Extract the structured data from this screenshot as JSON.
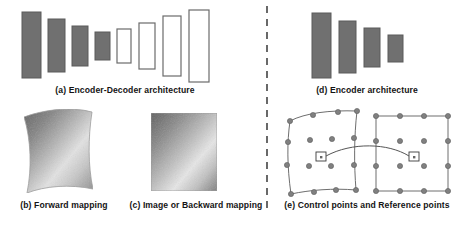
{
  "figure": {
    "width": 466,
    "height": 228,
    "background": "#ffffff",
    "divider": {
      "name": "dashed-vertical-divider",
      "x": 267,
      "y_start": 6,
      "y_end": 208,
      "style": "dashed",
      "color": "#444444"
    }
  },
  "captions": {
    "a": "(a) Encoder-Decoder architecture",
    "b": "(b) Forward mapping",
    "c": "(c) Image or Backward mapping",
    "d": "(d) Encoder architecture",
    "e": "(e) Control points and Reference points"
  },
  "colors": {
    "bar_fill": "#707070",
    "bar_stroke": "#5a5a5a",
    "empty_fill": "#ffffff",
    "empty_stroke": "#6b6b6b",
    "point_fill": "#808080",
    "point_stroke": "#5d5d5d",
    "grid_line": "#6e6e6e",
    "text": "#141414",
    "gradient_dark": "#5c5c5c",
    "gradient_light": "#f0f0f0"
  },
  "panel_a": {
    "label": "Encoder-Decoder architecture",
    "encoder_bars": [
      {
        "x": 22,
        "y": 12,
        "w": 19,
        "h": 66,
        "filled": true
      },
      {
        "x": 48,
        "y": 19,
        "w": 17,
        "h": 53,
        "filled": true
      },
      {
        "x": 72,
        "y": 26,
        "w": 16,
        "h": 40,
        "filled": true
      },
      {
        "x": 95,
        "y": 32,
        "w": 15,
        "h": 28,
        "filled": true
      }
    ],
    "decoder_bars": [
      {
        "x": 117,
        "y": 29,
        "w": 14,
        "h": 34,
        "filled": false
      },
      {
        "x": 139,
        "y": 23,
        "w": 16,
        "h": 46,
        "filled": false
      },
      {
        "x": 163,
        "y": 16,
        "w": 18,
        "h": 60,
        "filled": false
      },
      {
        "x": 189,
        "y": 10,
        "w": 20,
        "h": 72,
        "filled": false
      }
    ]
  },
  "panel_b": {
    "label": "Forward mapping",
    "shape": "warped-quadrilateral",
    "bounds": {
      "x": 22,
      "y": 112,
      "w": 71,
      "h": 81
    },
    "gradient": "diagonal-grayscale"
  },
  "panel_c": {
    "label": "Image or Backward mapping",
    "shape": "rectangle",
    "bounds": {
      "x": 151,
      "y": 113,
      "w": 66,
      "h": 78
    },
    "gradient": "diagonal-grayscale"
  },
  "panel_d": {
    "label": "Encoder architecture",
    "bars": [
      {
        "x": 312,
        "y": 13,
        "w": 19,
        "h": 65,
        "filled": true
      },
      {
        "x": 339,
        "y": 21,
        "w": 17,
        "h": 52,
        "filled": true
      },
      {
        "x": 364,
        "y": 28,
        "w": 16,
        "h": 39,
        "filled": true
      },
      {
        "x": 388,
        "y": 35,
        "w": 15,
        "h": 27,
        "filled": true
      }
    ]
  },
  "panel_e": {
    "label": "Control points and Reference points",
    "left_grid": {
      "name": "control-points-grid",
      "type": "warped",
      "rows": 4,
      "cols": 4,
      "points": [
        [
          290,
          121
        ],
        [
          313,
          115
        ],
        [
          338,
          113
        ],
        [
          357,
          111
        ],
        [
          287,
          142
        ],
        [
          310,
          140
        ],
        [
          332,
          139
        ],
        [
          352,
          138
        ],
        [
          285,
          164
        ],
        [
          308,
          165
        ],
        [
          330,
          165
        ],
        [
          351,
          164
        ],
        [
          291,
          194
        ],
        [
          314,
          192
        ],
        [
          336,
          191
        ],
        [
          356,
          190
        ]
      ],
      "marker": {
        "x": 320,
        "y": 157,
        "w": 9,
        "h": 8
      }
    },
    "right_grid": {
      "name": "reference-points-grid",
      "type": "regular",
      "rows": 4,
      "cols": 4,
      "points": [
        [
          376,
          116
        ],
        [
          400,
          116
        ],
        [
          424,
          116
        ],
        [
          448,
          116
        ],
        [
          376,
          141
        ],
        [
          400,
          141
        ],
        [
          424,
          141
        ],
        [
          448,
          141
        ],
        [
          376,
          166
        ],
        [
          400,
          166
        ],
        [
          424,
          166
        ],
        [
          448,
          166
        ],
        [
          376,
          191
        ],
        [
          400,
          191
        ],
        [
          424,
          191
        ],
        [
          448,
          191
        ]
      ],
      "marker": {
        "x": 412,
        "y": 156,
        "w": 9,
        "h": 8
      }
    },
    "connector": {
      "name": "mapping-arc",
      "from": [
        327,
        157
      ],
      "to": [
        412,
        157
      ],
      "control": [
        370,
        143
      ]
    }
  }
}
